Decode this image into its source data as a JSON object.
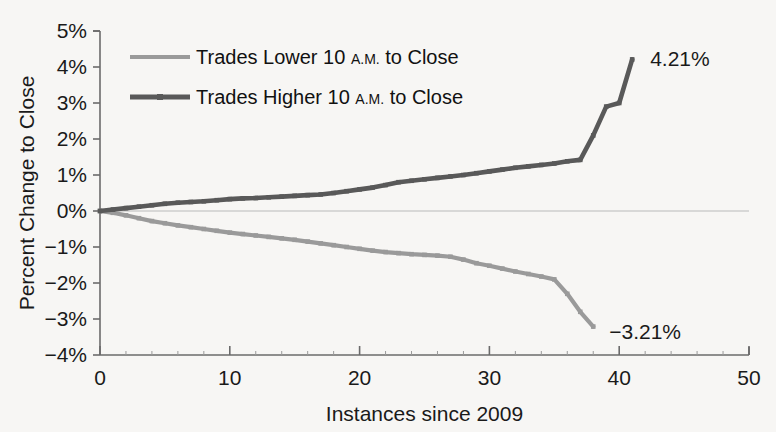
{
  "chart_data": {
    "type": "line",
    "title": "",
    "xlabel": "Instances since 2009",
    "ylabel": "Percent Change  to Close",
    "xlim": [
      0,
      50
    ],
    "ylim": [
      -4,
      5
    ],
    "grid": false,
    "legend_position": "top-left",
    "x_ticks": [
      "0",
      "10",
      "20",
      "30",
      "40",
      "50"
    ],
    "x_tick_values": [
      0,
      10,
      20,
      30,
      40,
      50
    ],
    "y_ticks": [
      "5%",
      "4%",
      "3%",
      "2%",
      "1%",
      "0%",
      "−1%",
      "−2%",
      "−3%",
      "−4%"
    ],
    "y_tick_values": [
      5,
      4,
      3,
      2,
      1,
      0,
      -1,
      -2,
      -3,
      -4
    ],
    "series": [
      {
        "name": "Trades Lower 10 A.M. to Close",
        "color": "#9a9a9a",
        "legend_main": "Trades Lower 10 ",
        "legend_small": "A.M.",
        "legend_tail": " to Close",
        "end_label": "−3.21%",
        "x": [
          0,
          1,
          2,
          3,
          4,
          5,
          6,
          7,
          8,
          9,
          10,
          11,
          12,
          13,
          14,
          15,
          16,
          17,
          18,
          19,
          20,
          21,
          22,
          23,
          24,
          25,
          26,
          27,
          28,
          29,
          30,
          31,
          32,
          33,
          34,
          35,
          36,
          37,
          38
        ],
        "values": [
          0.0,
          -0.05,
          -0.12,
          -0.2,
          -0.28,
          -0.34,
          -0.4,
          -0.45,
          -0.5,
          -0.55,
          -0.6,
          -0.64,
          -0.68,
          -0.72,
          -0.76,
          -0.8,
          -0.85,
          -0.9,
          -0.95,
          -1.0,
          -1.05,
          -1.1,
          -1.14,
          -1.17,
          -1.2,
          -1.22,
          -1.24,
          -1.27,
          -1.35,
          -1.45,
          -1.52,
          -1.6,
          -1.68,
          -1.75,
          -1.82,
          -1.9,
          -2.3,
          -2.8,
          -3.21
        ]
      },
      {
        "name": "Trades Higher 10 A.M. to Close",
        "color": "#595959",
        "legend_main": "Trades Higher 10 ",
        "legend_small": "A.M.",
        "legend_tail": " to Close",
        "end_label": "4.21%",
        "x": [
          0,
          1,
          2,
          3,
          4,
          5,
          6,
          7,
          8,
          9,
          10,
          11,
          12,
          13,
          14,
          15,
          16,
          17,
          18,
          19,
          20,
          21,
          22,
          23,
          24,
          25,
          26,
          27,
          28,
          29,
          30,
          31,
          32,
          33,
          34,
          35,
          36,
          37,
          38,
          39,
          40,
          41
        ],
        "values": [
          0.0,
          0.04,
          0.08,
          0.12,
          0.16,
          0.2,
          0.23,
          0.25,
          0.27,
          0.3,
          0.33,
          0.35,
          0.36,
          0.38,
          0.4,
          0.42,
          0.44,
          0.46,
          0.5,
          0.55,
          0.6,
          0.65,
          0.72,
          0.8,
          0.84,
          0.88,
          0.92,
          0.96,
          1.0,
          1.05,
          1.1,
          1.15,
          1.2,
          1.24,
          1.28,
          1.32,
          1.38,
          1.42,
          2.1,
          2.9,
          3.0,
          4.21
        ]
      }
    ]
  },
  "annotations": {
    "upper_end": "4.21%",
    "lower_end": "−3.21%"
  }
}
